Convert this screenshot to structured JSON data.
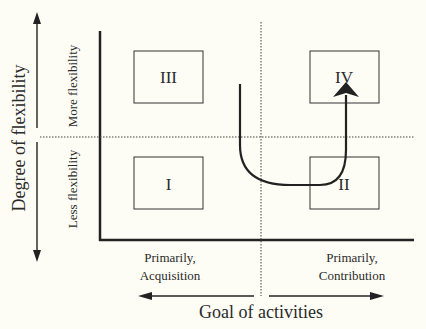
{
  "diagram": {
    "y_axis": {
      "title": "Degree of flexibility",
      "upper_label": "More flexibility",
      "lower_label": "Less flexibility"
    },
    "x_axis": {
      "title": "Goal of activities",
      "left_label_line1": "Primarily,",
      "left_label_line2": "Acquisition",
      "right_label_line1": "Primarily,",
      "right_label_line2": "Contribution"
    },
    "quadrants": [
      {
        "id": "III",
        "label": "III",
        "position": "top-left"
      },
      {
        "id": "IV",
        "label": "IV",
        "position": "top-right"
      },
      {
        "id": "I",
        "label": "I",
        "position": "bottom-left"
      },
      {
        "id": "II",
        "label": "II",
        "position": "bottom-right"
      }
    ],
    "path_arrow": {
      "description": "U-shaped arrow from upper center down through lower region, ending in quadrant IV"
    },
    "colors": {
      "background": "#fdfdf5",
      "line": "#222222"
    }
  }
}
